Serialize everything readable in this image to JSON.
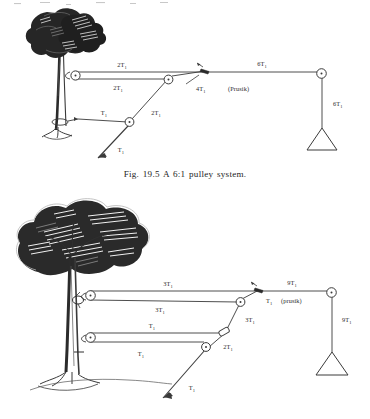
{
  "page": {
    "background_color": "#ffffff",
    "ink_color": "#2b2b2b",
    "width": 370,
    "height": 419
  },
  "figures": [
    {
      "id": "fig-19-5",
      "caption": "Fig. 19.5 A 6:1 pulley system.",
      "ratio": "6:1",
      "anchor": "tree",
      "labels": [
        {
          "name": "upper-top-rope-label",
          "text": "2T",
          "sub": "1"
        },
        {
          "name": "upper-second-rope-label",
          "text": "2T",
          "sub": "1"
        },
        {
          "name": "upper-third-rope-label",
          "text": "T",
          "sub": "1"
        },
        {
          "name": "upper-diagonal-label",
          "text": "2T",
          "sub": "1"
        },
        {
          "name": "upper-prusik-tension",
          "text": "4T",
          "sub": "1"
        },
        {
          "name": "upper-prusik-note",
          "text": "(Prusik)",
          "sub": ""
        },
        {
          "name": "upper-load-rope-label",
          "text": "6T",
          "sub": "1"
        },
        {
          "name": "upper-load-vertical",
          "text": "6T",
          "sub": "1"
        },
        {
          "name": "upper-haul-label",
          "text": "T",
          "sub": "1"
        }
      ]
    },
    {
      "id": "fig-9to1",
      "caption": "",
      "ratio": "9:1",
      "anchor": "tree",
      "labels": [
        {
          "name": "lower-top-rope-label",
          "text": "3T",
          "sub": "1"
        },
        {
          "name": "lower-second-rope-label",
          "text": "3T",
          "sub": "1"
        },
        {
          "name": "lower-third-rope-label",
          "text": "T",
          "sub": "1"
        },
        {
          "name": "lower-fourth-rope-label",
          "text": "T",
          "sub": "1"
        },
        {
          "name": "lower-upper-diagonal",
          "text": "3T",
          "sub": "1"
        },
        {
          "name": "lower-lower-diagonal",
          "text": "2T",
          "sub": "1"
        },
        {
          "name": "lower-prusik-tension",
          "text": "T",
          "sub": "1"
        },
        {
          "name": "lower-prusik-note",
          "text": "(prusik)",
          "sub": ""
        },
        {
          "name": "lower-load-rope-label",
          "text": "9T",
          "sub": "1"
        },
        {
          "name": "lower-load-vertical",
          "text": "9T",
          "sub": "1"
        },
        {
          "name": "lower-haul-label",
          "text": "T",
          "sub": "1"
        }
      ]
    }
  ]
}
